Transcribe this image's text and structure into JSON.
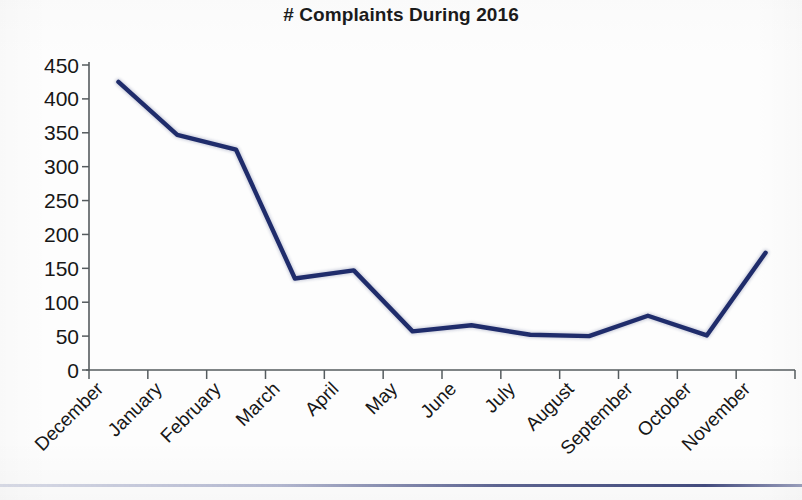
{
  "chart_data": {
    "type": "line",
    "title": "# Complaints During 2016",
    "xlabel": "",
    "ylabel": "",
    "categories": [
      "December",
      "January",
      "February",
      "March",
      "April",
      "May",
      "June",
      "July",
      "August",
      "September",
      "October",
      "November"
    ],
    "values": [
      425,
      347,
      325,
      135,
      147,
      57,
      66,
      52,
      50,
      80,
      51,
      173
    ],
    "series": [
      {
        "name": "# Complaints",
        "values": [
          425,
          347,
          325,
          135,
          147,
          57,
          66,
          52,
          50,
          80,
          51,
          173
        ]
      }
    ],
    "ylim": [
      0,
      450
    ],
    "ytick_labels": [
      "0",
      "50",
      "100",
      "150",
      "200",
      "250",
      "300",
      "350",
      "400",
      "450"
    ],
    "ytick_values": [
      0,
      50,
      100,
      150,
      200,
      250,
      300,
      350,
      400,
      450
    ],
    "grid": false,
    "legend": false,
    "legend_position": "none",
    "line_color": "#1f2c6b",
    "axis_color": "#555b5e",
    "background_color": "#ffffff",
    "xtick_label_rotation": -45
  }
}
